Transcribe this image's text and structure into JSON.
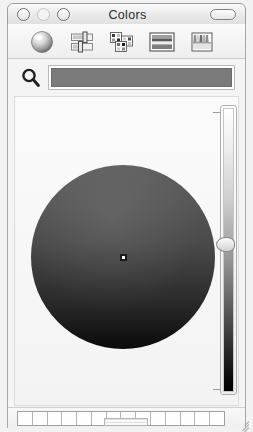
{
  "window": {
    "title": "Colors",
    "controls": [
      {
        "name": "close",
        "label": "Close"
      },
      {
        "name": "minimize",
        "label": "Minimize"
      },
      {
        "name": "zoom",
        "label": "Zoom"
      }
    ],
    "toolbar_toggle_label": ""
  },
  "toolbar": {
    "items": [
      {
        "icon": "color-wheel-icon",
        "label": "Color Wheel",
        "selected": true
      },
      {
        "icon": "color-sliders-icon",
        "label": "Color Sliders",
        "selected": false
      },
      {
        "icon": "color-palettes-icon",
        "label": "Color Palettes",
        "selected": false
      },
      {
        "icon": "image-palettes-icon",
        "label": "Image Palettes",
        "selected": false
      },
      {
        "icon": "crayons-icon",
        "label": "Crayons",
        "selected": false
      }
    ]
  },
  "picker": {
    "magnifier_icon": "magnifier-icon",
    "preview_color": "#7b7b7b",
    "preview_label": ""
  },
  "wheel": {
    "marker_x_pct": 50,
    "marker_y_pct": 50,
    "selected_color": "#4a4a4a"
  },
  "brightness": {
    "label": "",
    "value_pct": 46,
    "top_color": "#ffffff",
    "bottom_color": "#000000"
  },
  "palette": {
    "cell_count": 14,
    "cells": [
      {
        "color": "#fefefe"
      },
      {
        "color": "#fefefe"
      },
      {
        "color": "#fefefe"
      },
      {
        "color": "#fefefe"
      },
      {
        "color": "#fefefe"
      },
      {
        "color": "#fefefe"
      },
      {
        "color": "#fefefe"
      },
      {
        "color": "#fefefe"
      },
      {
        "color": "#fefefe"
      },
      {
        "color": "#fefefe"
      },
      {
        "color": "#fefefe"
      },
      {
        "color": "#fefefe"
      },
      {
        "color": "#fefefe"
      },
      {
        "color": "#fefefe"
      }
    ]
  },
  "footer": {
    "grab_handle_label": "",
    "resize_grip_label": ""
  },
  "colors": {
    "accent": "#7b7b7b",
    "window_bg": "#f2f2f2",
    "frame_border": "#a8a8a8"
  }
}
